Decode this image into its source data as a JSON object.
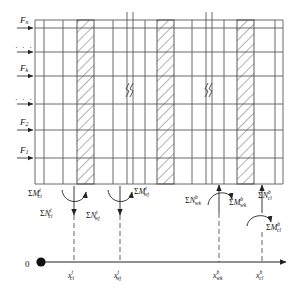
{
  "figure": {
    "kind": "structural-mechanics-diagram",
    "title_caption": "",
    "origin_label": "0",
    "colors": {
      "line": "#4a4a4a",
      "heavy_line": "#2b2b2b",
      "hatch": "#555555",
      "dashed": "#3a3a3a",
      "text": "#111111",
      "background": "#ffffff"
    }
  },
  "story_forces": {
    "description": "Lateral story forces applied at floor levels on the left side of the frame",
    "items": [
      {
        "label": "F",
        "sub": "n",
        "y": 28,
        "type": "force"
      },
      {
        "label": "",
        "sub": "",
        "y": 52,
        "type": "dots",
        "dots": "· · ·"
      },
      {
        "label": "F",
        "sub": "k",
        "y": 76,
        "type": "force"
      },
      {
        "label": "",
        "sub": "",
        "y": 104,
        "type": "dots",
        "dots": "· · ·"
      },
      {
        "label": "F",
        "sub": "2",
        "y": 130,
        "type": "force"
      },
      {
        "label": "F",
        "sub": "1",
        "y": 158,
        "type": "force"
      }
    ]
  },
  "frame": {
    "top_y": 20,
    "base_y": 184,
    "left_x": 35,
    "right_x": 283,
    "floor_lines_y": [
      20,
      28,
      52,
      76,
      104,
      130,
      158,
      184
    ],
    "columns_x": [
      44,
      63,
      92,
      113,
      131,
      152,
      175,
      192,
      211,
      232,
      255,
      275
    ],
    "walls": [
      {
        "x": 77,
        "width": 16,
        "name": "shear-wall-1"
      },
      {
        "x": 156,
        "width": 16,
        "name": "shear-wall-2"
      },
      {
        "x": 236,
        "width": 16,
        "name": "shear-wall-3"
      }
    ],
    "break_marks": [
      {
        "x": 122,
        "y": 92,
        "name": "break-mark-1"
      },
      {
        "x": 201,
        "y": 92,
        "name": "break-mark-2"
      }
    ]
  },
  "reactions": [
    {
      "name": "column-i-top",
      "x": 74,
      "axial": {
        "sigma": "Σ",
        "base": "N",
        "sub": "ci",
        "sup": "t"
      },
      "moment": {
        "sigma": "Σ",
        "base": "M",
        "sub": "ci",
        "sup": "t"
      },
      "axial_dir": "down",
      "moment_label_side": "left",
      "axis_tick": {
        "sigma": "",
        "base": "x",
        "sub": "ci",
        "sup": "t"
      }
    },
    {
      "name": "wall-j-top",
      "x": 120,
      "axial": {
        "sigma": "Σ",
        "base": "N",
        "sub": "wj",
        "sup": "t"
      },
      "moment": {
        "sigma": "Σ",
        "base": "M",
        "sub": "wj",
        "sup": "t"
      },
      "axial_dir": "down",
      "moment_label_side": "right",
      "axis_tick": {
        "sigma": "",
        "base": "x",
        "sub": "wj",
        "sup": "t"
      }
    },
    {
      "name": "wall-k-bottom",
      "x": 219,
      "axial": {
        "sigma": "Σ",
        "base": "N",
        "sub": "wk",
        "sup": "b"
      },
      "moment": {
        "sigma": "Σ",
        "base": "M",
        "sub": "wk",
        "sup": "b"
      },
      "axial_dir": "up",
      "moment_label_side": "right",
      "axis_tick": {
        "sigma": "",
        "base": "x",
        "sub": "wk",
        "sup": "b"
      }
    },
    {
      "name": "column-l-bottom",
      "x": 262,
      "axial": {
        "sigma": "Σ",
        "base": "N",
        "sub": "cl",
        "sup": "b"
      },
      "moment": {
        "sigma": "Σ",
        "base": "M",
        "sub": "cl",
        "sup": "b"
      },
      "axial_dir": "up",
      "moment_label_side": "right",
      "axis_tick": {
        "sigma": "",
        "base": "x",
        "sub": "cl",
        "sup": "b"
      }
    }
  ],
  "axis": {
    "name": "x-axis",
    "y": 262,
    "start_x": 30,
    "end_x": 290,
    "origin_dot_x": 41,
    "origin_label": "0",
    "arrow": true
  }
}
